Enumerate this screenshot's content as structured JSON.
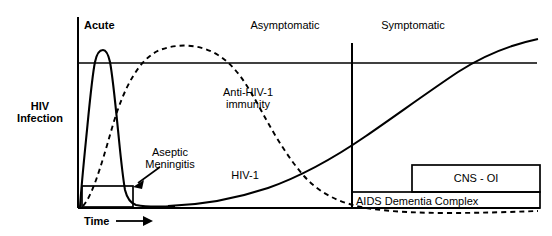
{
  "figure": {
    "type": "natural-history-of-hiv-infection-schematic",
    "axes": {
      "y_axis_label": "HIV\nInfection",
      "y_axis_label_line1": "HIV",
      "y_axis_label_line2": "Infection",
      "x_axis_label": "Time",
      "x_axis_arrow": "right-arrow"
    },
    "stage_labels": [
      {
        "id": "acute",
        "text": "Acute",
        "bold": true
      },
      {
        "id": "asymptomatic",
        "text": "Asymptomatic",
        "bold": false
      },
      {
        "id": "symptomatic",
        "text": "Symptomatic",
        "bold": false
      }
    ],
    "curves": [
      {
        "id": "hiv-1-viral-load",
        "label": "HIV-1",
        "style": "solid",
        "description": "Sharp acute spike, drop to low plateau, gradual late rise"
      },
      {
        "id": "anti-hiv-1-immunity",
        "label_line1": "Anti-HIV-1",
        "label_line2": "immunity",
        "style": "dashed",
        "description": "Rises after acute phase, broad plateau, slow decline"
      }
    ],
    "event_boxes": [
      {
        "id": "aseptic-meningitis",
        "text": "Aseptic\nMeningitis",
        "line1": "Aseptic",
        "line2": "Meningitis",
        "has_arrow": true
      },
      {
        "id": "aids-dementia-complex",
        "text": "AIDS Dementia Complex"
      },
      {
        "id": "cns-oi",
        "text": "CNS - OI"
      }
    ],
    "colors": {
      "stroke": "#000000",
      "text": "#000000",
      "background": "#ffffff"
    }
  }
}
